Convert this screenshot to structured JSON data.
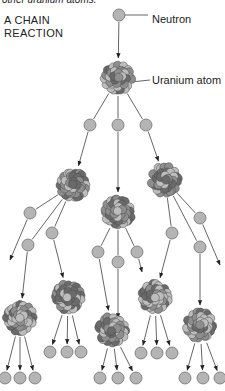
{
  "caption_fragment": "other uranium atoms.",
  "title_line1": "A CHAIN",
  "title_line2": "REACTION",
  "labels": {
    "neutron": "Neutron",
    "uranium_atom": "Uranium atom"
  },
  "colors": {
    "neutron_fill": "#b4b4b4",
    "neutron_stroke": "#707070",
    "nucleon_light": "#bdbdbd",
    "nucleon_mid": "#8e8e8e",
    "nucleon_dark": "#6a6a6a",
    "arrow": "#333333"
  },
  "diagram": {
    "neutron_radius": 6,
    "atom_radius": 18,
    "generations": [
      {
        "level": 0,
        "neutrons": [
          [
            119,
            15
          ]
        ],
        "atoms": [
          [
            118,
            78
          ]
        ]
      },
      {
        "level": 1,
        "neutrons": [
          [
            90,
            125
          ],
          [
            118,
            125
          ],
          [
            146,
            125
          ]
        ],
        "atoms": [
          [
            73,
            185
          ],
          [
            118,
            212
          ],
          [
            165,
            180
          ]
        ]
      },
      {
        "level": 2,
        "neutrons": [
          [
            30,
            213
          ],
          [
            28,
            245
          ],
          [
            52,
            233
          ],
          [
            98,
            252
          ],
          [
            118,
            262
          ],
          [
            137,
            252
          ],
          [
            172,
            233
          ],
          [
            200,
            218
          ],
          [
            200,
            247
          ]
        ],
        "atoms": [
          [
            20,
            318
          ],
          [
            68,
            297
          ],
          [
            112,
            330
          ],
          [
            155,
            297
          ],
          [
            200,
            325
          ]
        ]
      },
      {
        "level": 3,
        "neutrons": [
          [
            5,
            378
          ],
          [
            20,
            378
          ],
          [
            35,
            378
          ],
          [
            50,
            352
          ],
          [
            67,
            352
          ],
          [
            81,
            352
          ],
          [
            100,
            378
          ],
          [
            118,
            378
          ],
          [
            136,
            378
          ],
          [
            141,
            353
          ],
          [
            157,
            353
          ],
          [
            172,
            353
          ],
          [
            185,
            378
          ],
          [
            203,
            378
          ],
          [
            220,
            378
          ]
        ]
      }
    ]
  }
}
